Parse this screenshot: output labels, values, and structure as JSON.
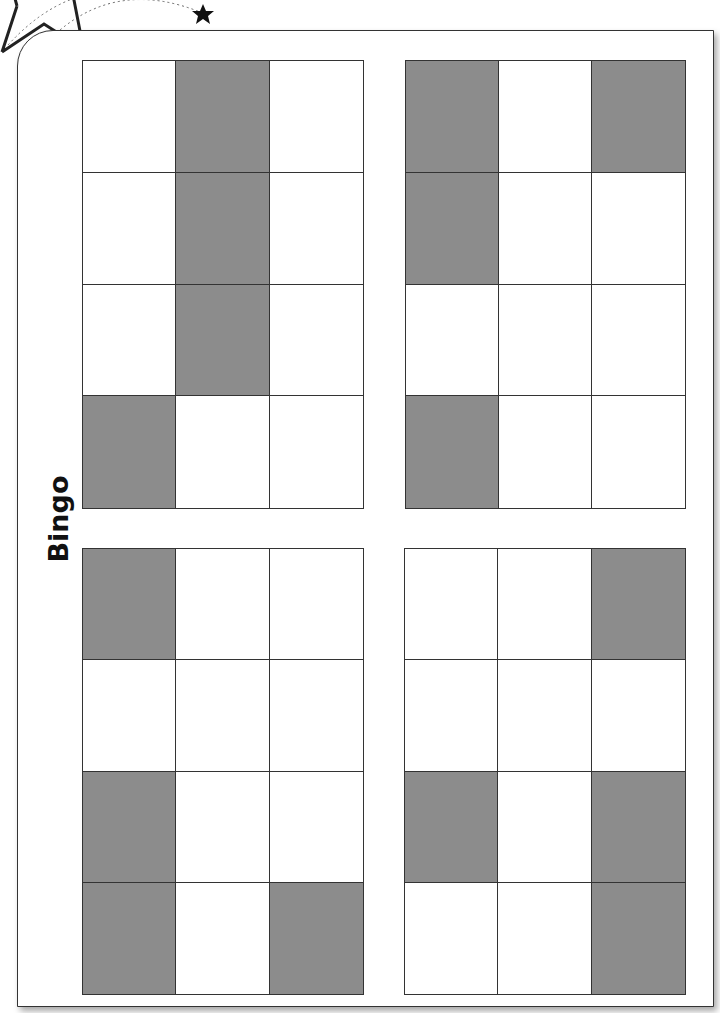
{
  "title": "Bingo",
  "colors": {
    "filled": "#8c8c8c",
    "empty": "#ffffff",
    "line": "#333333"
  },
  "cards": [
    {
      "name": "bingo-card-top-left",
      "pos": [
        82,
        60,
        282,
        449
      ],
      "cells": [
        [
          0,
          1,
          0
        ],
        [
          0,
          1,
          0
        ],
        [
          0,
          1,
          0
        ],
        [
          1,
          0,
          0
        ]
      ]
    },
    {
      "name": "bingo-card-top-right",
      "pos": [
        405,
        60,
        281,
        449
      ],
      "cells": [
        [
          1,
          0,
          1
        ],
        [
          1,
          0,
          0
        ],
        [
          0,
          0,
          0
        ],
        [
          1,
          0,
          0
        ]
      ]
    },
    {
      "name": "bingo-card-bottom-left",
      "pos": [
        82,
        548,
        282,
        447
      ],
      "cells": [
        [
          1,
          0,
          0
        ],
        [
          0,
          0,
          0
        ],
        [
          1,
          0,
          0
        ],
        [
          1,
          0,
          1
        ]
      ]
    },
    {
      "name": "bingo-card-bottom-right",
      "pos": [
        404,
        548,
        282,
        447
      ],
      "cells": [
        [
          0,
          0,
          1
        ],
        [
          0,
          0,
          0
        ],
        [
          1,
          0,
          1
        ],
        [
          0,
          0,
          1
        ]
      ]
    }
  ]
}
